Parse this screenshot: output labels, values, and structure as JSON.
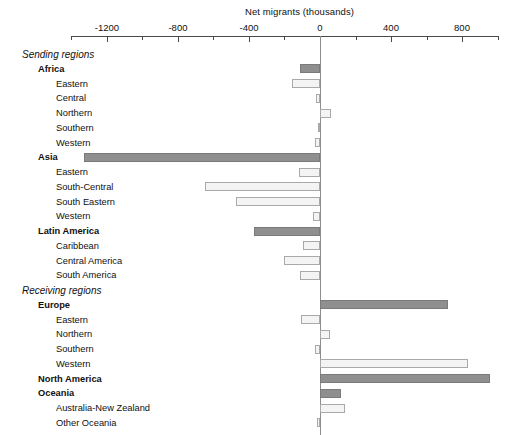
{
  "chart_data": {
    "type": "bar",
    "orientation": "horizontal",
    "title": "Net migrants (thousands)",
    "xlabel": "Net migrants (thousands)",
    "ylabel": "",
    "xlim": [
      -1400,
      1000
    ],
    "grid": false,
    "legend": null,
    "axis_ticks": [
      {
        "value": -1200,
        "label": "-1200"
      },
      {
        "value": -800,
        "label": "-800"
      },
      {
        "value": -400,
        "label": "-400"
      },
      {
        "value": 0,
        "label": "0"
      },
      {
        "value": 400,
        "label": "400"
      },
      {
        "value": 800,
        "label": "800"
      }
    ],
    "minor_tick_values": [
      -1400,
      -1000,
      -600,
      -200,
      200,
      600,
      1000
    ],
    "categories": [
      "Sending regions",
      "Africa",
      "Eastern",
      "Central",
      "Northern",
      "Southern",
      "Western",
      "Asia",
      "Eastern",
      "South-Central",
      "South Eastern",
      "Western",
      "Latin America",
      "Caribbean",
      "Central America",
      "South America",
      "Receiving regions",
      "Europe",
      "Eastern",
      "Northern",
      "Southern",
      "Western",
      "North America",
      "Oceania",
      "Australia-New Zealand",
      "Other Oceania"
    ],
    "rows": [
      {
        "label": "Sending regions",
        "level": "section",
        "value": null
      },
      {
        "label": "Africa",
        "level": "major",
        "value": -110
      },
      {
        "label": "Eastern",
        "level": "minor",
        "value": -155
      },
      {
        "label": "Central",
        "level": "minor",
        "value": -25
      },
      {
        "label": "Northern",
        "level": "minor",
        "value": 62
      },
      {
        "label": "Southern",
        "level": "minor",
        "value": -12
      },
      {
        "label": "Western",
        "level": "minor",
        "value": -28
      },
      {
        "label": "Asia",
        "level": "major",
        "value": -1330
      },
      {
        "label": "Eastern",
        "level": "minor",
        "value": -120
      },
      {
        "label": "South-Central",
        "level": "minor",
        "value": -648
      },
      {
        "label": "South Eastern",
        "level": "minor",
        "value": -472
      },
      {
        "label": "Western",
        "level": "minor",
        "value": -40
      },
      {
        "label": "Latin America",
        "level": "major",
        "value": -372
      },
      {
        "label": "Caribbean",
        "level": "minor",
        "value": -98
      },
      {
        "label": "Central America",
        "level": "minor",
        "value": -202
      },
      {
        "label": "South America",
        "level": "minor",
        "value": -112
      },
      {
        "label": "Receiving regions",
        "level": "section",
        "value": null
      },
      {
        "label": "Europe",
        "level": "major",
        "value": 722
      },
      {
        "label": "Eastern",
        "level": "minor",
        "value": -105
      },
      {
        "label": "Northern",
        "level": "minor",
        "value": 58
      },
      {
        "label": "Southern",
        "level": "minor",
        "value": -30
      },
      {
        "label": "Western",
        "level": "minor",
        "value": 832
      },
      {
        "label": "North America",
        "level": "major",
        "value": 958
      },
      {
        "label": "Oceania",
        "level": "major",
        "value": 118
      },
      {
        "label": "Australia-New Zealand",
        "level": "minor",
        "value": 142
      },
      {
        "label": "Other Oceania",
        "level": "minor",
        "value": -16
      }
    ],
    "colors": {
      "major_bar_fill": "#8f8f8f",
      "major_bar_stroke": "#7b7b7b",
      "minor_bar_fill": "#f4f4f4",
      "minor_bar_stroke": "#a9a9a9",
      "axis": "#4a4a4a",
      "text": "#111111"
    }
  }
}
